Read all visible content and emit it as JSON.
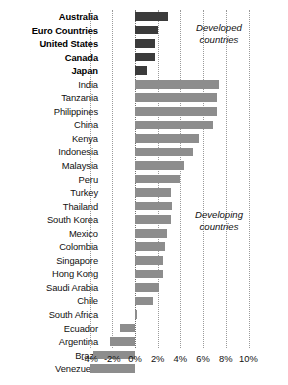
{
  "chart_data": {
    "type": "bar",
    "orientation": "horizontal",
    "title": "",
    "subtitle": "",
    "xlabel": "",
    "ylabel": "",
    "xlim": [
      -4,
      10
    ],
    "grid": true,
    "legend_position": "none",
    "xticks": [
      -4,
      -2,
      0,
      2,
      4,
      6,
      8,
      10
    ],
    "xtick_labels": [
      "-4%",
      "-2%",
      "0%",
      "2%",
      "4%",
      "6%",
      "8%",
      "10%"
    ],
    "annotations": [
      {
        "id": "developed",
        "text_line1": "Developed",
        "text_line2": "countries"
      },
      {
        "id": "developing",
        "text_line1": "Developing",
        "text_line2": "countries"
      }
    ],
    "group_colors": {
      "developed": "#3b3b3b",
      "developing": "#8d8d8d"
    },
    "categories": [
      "Australia",
      "Euro Countries",
      "United States",
      "Canada",
      "Japan",
      "India",
      "Tanzania",
      "Philippines",
      "China",
      "Kenya",
      "Indonesia",
      "Malaysia",
      "Peru",
      "Turkey",
      "Thailand",
      "South Korea",
      "Mexico",
      "Colombia",
      "Singapore",
      "Hong Kong",
      "Saudi Arabia",
      "Chile",
      "South Africa",
      "Ecuador",
      "Argentina",
      "Brazil",
      "Venezuela"
    ],
    "values": [
      2.9,
      2.0,
      1.75,
      1.75,
      1.1,
      7.4,
      7.2,
      7.2,
      6.9,
      5.6,
      5.1,
      4.3,
      4.0,
      3.2,
      3.3,
      3.2,
      2.8,
      2.6,
      2.5,
      2.5,
      2.1,
      1.6,
      0.15,
      -1.3,
      -2.2,
      -3.7,
      -4.0
    ],
    "groups": [
      "developed",
      "developed",
      "developed",
      "developed",
      "developed",
      "developing",
      "developing",
      "developing",
      "developing",
      "developing",
      "developing",
      "developing",
      "developing",
      "developing",
      "developing",
      "developing",
      "developing",
      "developing",
      "developing",
      "developing",
      "developing",
      "developing",
      "developing",
      "developing",
      "developing",
      "developing",
      "developing"
    ]
  }
}
